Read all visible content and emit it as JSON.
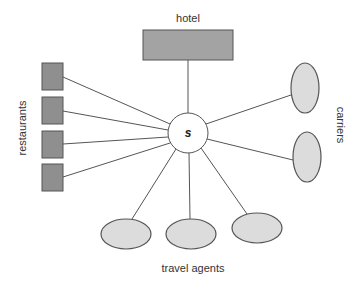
{
  "diagram": {
    "type": "hub-and-spoke",
    "center": {
      "label": "s",
      "cx": 188,
      "cy": 133,
      "r": 20,
      "fill": "#ffffff"
    },
    "colors": {
      "rect_fill": "#8f8f8f",
      "hotel_fill": "#a3a3a3",
      "ellipse_fill": "#dcdcdc",
      "stroke": "#555555"
    },
    "groups": {
      "hotel": {
        "label": "hotel",
        "nodes": [
          {
            "x": 143,
            "y": 30,
            "w": 90,
            "h": 30
          }
        ]
      },
      "restaurants": {
        "label": "restaurants",
        "nodes": [
          {
            "x": 42,
            "y": 63,
            "w": 21,
            "h": 27
          },
          {
            "x": 42,
            "y": 97,
            "w": 21,
            "h": 27
          },
          {
            "x": 42,
            "y": 131,
            "w": 21,
            "h": 27
          },
          {
            "x": 42,
            "y": 164,
            "w": 21,
            "h": 27
          }
        ]
      },
      "carriers": {
        "label": "carriers",
        "nodes": [
          {
            "cx": 305,
            "cy": 88,
            "rx": 14,
            "ry": 25
          },
          {
            "cx": 307,
            "cy": 157,
            "rx": 14,
            "ry": 25
          }
        ]
      },
      "travel_agents": {
        "label": "travel agents",
        "nodes": [
          {
            "cx": 126,
            "cy": 234,
            "rx": 25,
            "ry": 15
          },
          {
            "cx": 191,
            "cy": 234,
            "rx": 25,
            "ry": 15
          },
          {
            "cx": 257,
            "cy": 228,
            "rx": 25,
            "ry": 15
          }
        ]
      }
    }
  }
}
